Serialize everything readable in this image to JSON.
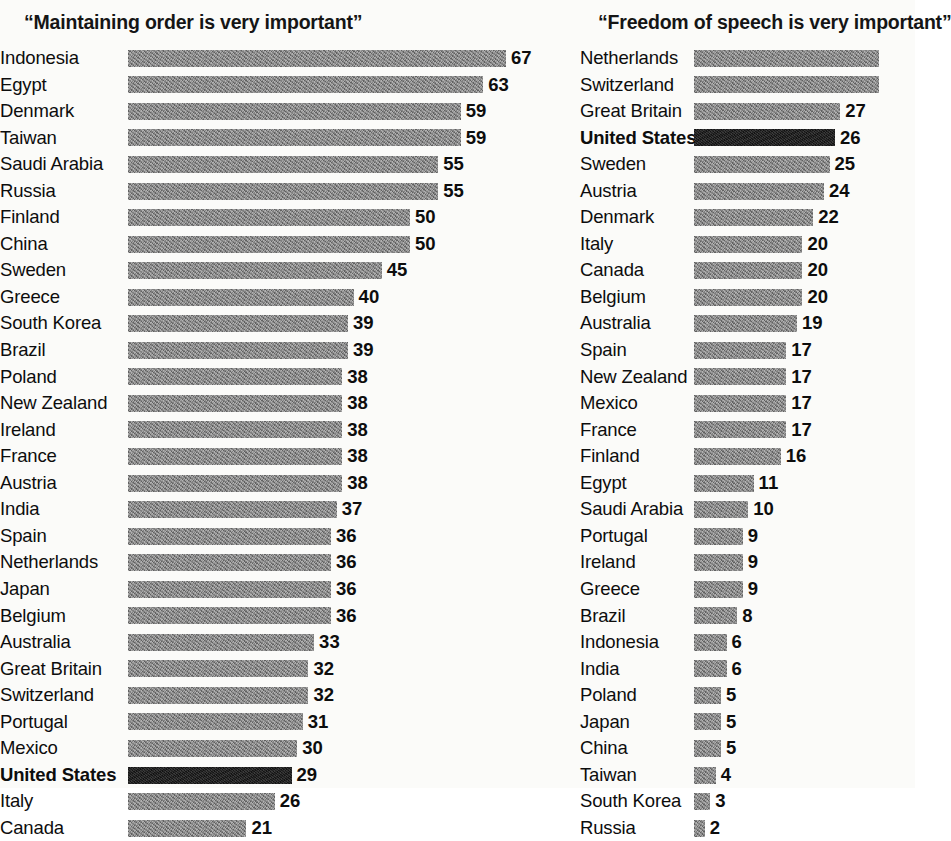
{
  "chart_data": [
    {
      "type": "bar",
      "orientation": "horizontal",
      "title": "“Maintaining order is very important”",
      "xlabel": "",
      "ylabel": "",
      "xlim": [
        0,
        70
      ],
      "grid": false,
      "legend": "none",
      "highlight_category": "United States",
      "highlight_color": "#1b1b1b",
      "bar_color": "#838383",
      "categories": [
        "Indonesia",
        "Egypt",
        "Denmark",
        "Taiwan",
        "Saudi Arabia",
        "Russia",
        "Finland",
        "China",
        "Sweden",
        "Greece",
        "South Korea",
        "Brazil",
        "Poland",
        "New Zealand",
        "Ireland",
        "France",
        "Austria",
        "India",
        "Spain",
        "Netherlands",
        "Japan",
        "Belgium",
        "Australia",
        "Great Britain",
        "Switzerland",
        "Portugal",
        "Mexico",
        "United States",
        "Italy",
        "Canada"
      ],
      "values": [
        67,
        63,
        59,
        59,
        55,
        55,
        50,
        50,
        45,
        40,
        39,
        39,
        38,
        38,
        38,
        38,
        38,
        37,
        36,
        36,
        36,
        36,
        33,
        32,
        32,
        31,
        30,
        29,
        26,
        21
      ]
    },
    {
      "type": "bar",
      "orientation": "horizontal",
      "title": "“Freedom of speech is very important”",
      "xlabel": "",
      "ylabel": "",
      "xlim": [
        0,
        40
      ],
      "grid": false,
      "legend": "none",
      "highlight_category": "United States",
      "highlight_color": "#1b1b1b",
      "bar_color": "#838383",
      "note": "Netherlands and Switzerland bars extend past the right edge of the image; their value labels are cropped out of frame.",
      "categories": [
        "Netherlands",
        "Switzerland",
        "Great Britain",
        "United States",
        "Sweden",
        "Austria",
        "Denmark",
        "Italy",
        "Canada",
        "Belgium",
        "Australia",
        "Spain",
        "New Zealand",
        "Mexico",
        "France",
        "Finland",
        "Egypt",
        "Saudi Arabia",
        "Portugal",
        "Ireland",
        "Greece",
        "Brazil",
        "Indonesia",
        "India",
        "Poland",
        "Japan",
        "China",
        "Taiwan",
        "South Korea",
        "Russia"
      ],
      "values": [
        36,
        35,
        27,
        26,
        25,
        24,
        22,
        20,
        20,
        20,
        19,
        17,
        17,
        17,
        17,
        16,
        11,
        10,
        9,
        9,
        9,
        8,
        6,
        6,
        5,
        5,
        5,
        4,
        3,
        2
      ],
      "value_labels": [
        "",
        "",
        "27",
        "26",
        "25",
        "24",
        "22",
        "20",
        "20",
        "20",
        "19",
        "17",
        "17",
        "17",
        "17",
        "16",
        "11",
        "10",
        "9",
        "9",
        "9",
        "8",
        "6",
        "6",
        "5",
        "5",
        "5",
        "4",
        "3",
        "2"
      ]
    }
  ]
}
